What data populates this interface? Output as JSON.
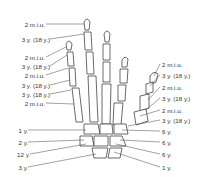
{
  "diagram": {
    "left_labels": [
      {
        "text": "2 m.i.u.",
        "y": 21
      },
      {
        "text": "3 y. (18 y.)",
        "y": 36
      },
      {
        "text": "2 m.i.u.",
        "y": 54
      },
      {
        "text": "3 y. (18 y.)",
        "y": 63
      },
      {
        "text": "2 m.i.u.",
        "y": 72
      },
      {
        "text": "3 y. (18 y.)",
        "y": 82
      },
      {
        "text": "3 y. (18 y.)",
        "y": 91
      },
      {
        "text": "2 m.i.u.",
        "y": 100
      },
      {
        "text": "1 y.",
        "y": 127
      },
      {
        "text": "2 y.",
        "y": 139
      },
      {
        "text": "12 y.",
        "y": 151
      },
      {
        "text": "3 y.",
        "y": 164
      }
    ],
    "right_labels": [
      {
        "text": "2 m.i.u.",
        "y": 61
      },
      {
        "text": "3 y. (18 y.)",
        "y": 72
      },
      {
        "text": "2 m.i.u.",
        "y": 84
      },
      {
        "text": "3 y. (18 y.)",
        "y": 95
      },
      {
        "text": "2 m.i.u.",
        "y": 107
      },
      {
        "text": "3 y. (18 y.)",
        "y": 117
      },
      {
        "text": "6 y.",
        "y": 128
      },
      {
        "text": "6 y.",
        "y": 139
      },
      {
        "text": "6 y.",
        "y": 151
      },
      {
        "text": "1 y.",
        "y": 164
      }
    ],
    "colors": {
      "line": "#333333",
      "bone_fill": "#ffffff",
      "text": "#333333"
    }
  }
}
